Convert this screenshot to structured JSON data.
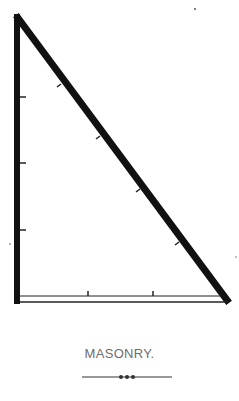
{
  "figure": {
    "stroke_color": "#111111",
    "background": "#ffffff",
    "vertical_ticks_y": [
      97,
      163,
      230
    ],
    "hypotenuse_ticks": [
      [
        60,
        85
      ],
      [
        98,
        137
      ],
      [
        138,
        190
      ],
      [
        178,
        243
      ]
    ],
    "base_ticks_x": [
      88,
      153
    ]
  },
  "caption": {
    "text": "MASONRY.",
    "color": "#6e6e6e"
  },
  "ornament": {
    "type": "line-with-three-dots",
    "color": "#333333"
  }
}
